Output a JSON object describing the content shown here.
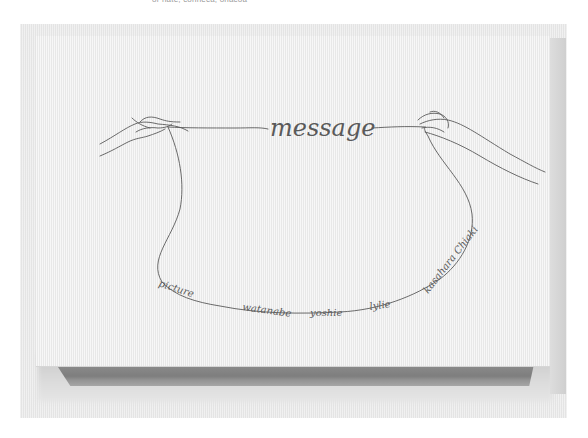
{
  "caption": {
    "text": "or nate, conneca, onacoa"
  },
  "cover": {
    "title": "message",
    "names": [
      "picture",
      "watanabe",
      "yoshie",
      "lylie",
      "kasahara Chiaki"
    ],
    "line_color": "#5a5a5a",
    "surface_color": "#efefef",
    "spine_color": "#858585"
  }
}
